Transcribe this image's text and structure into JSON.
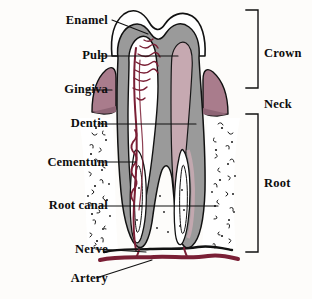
{
  "diagram": {
    "background_color": "#fdfcfa",
    "ink_color": "#111111"
  },
  "labels_left": [
    {
      "id": "enamel",
      "text": "Enamel",
      "x": 28,
      "y": 14,
      "w": 80
    },
    {
      "id": "pulp",
      "text": "Pulp",
      "x": 28,
      "y": 49,
      "w": 80
    },
    {
      "id": "gingiva",
      "text": "Gingiva",
      "x": 20,
      "y": 83,
      "w": 88
    },
    {
      "id": "dentin",
      "text": "Dentin",
      "x": 24,
      "y": 117,
      "w": 84
    },
    {
      "id": "cementum",
      "text": "Cementum",
      "x": 6,
      "y": 156,
      "w": 102
    },
    {
      "id": "root-canal",
      "text": "Root canal",
      "x": 10,
      "y": 199,
      "w": 98
    },
    {
      "id": "nerve",
      "text": "Nerve",
      "x": 38,
      "y": 243,
      "w": 70
    },
    {
      "id": "artery",
      "text": "Artery",
      "x": 36,
      "y": 272,
      "w": 72
    }
  ],
  "labels_right": [
    {
      "id": "crown",
      "text": "Crown",
      "x": 264,
      "y": 47
    },
    {
      "id": "neck",
      "text": "Neck",
      "x": 264,
      "y": 98
    },
    {
      "id": "root",
      "text": "Root",
      "x": 264,
      "y": 177
    }
  ],
  "colors": {
    "enamel": "#ffffff",
    "dentin": "#9a9a9a",
    "pulp": "#c9aab3",
    "pulp_chamber": "#ffffff",
    "gingiva": "#a97c8c",
    "gingiva_dark": "#8e6575",
    "vessel": "#7a1f35",
    "artery": "#7a1f35",
    "nerve": "#111111",
    "bone": "#ffffff",
    "outline": "#111111"
  },
  "structures": [
    {
      "name": "crown-enamel",
      "layer": "enamel",
      "region": "crown outer shell"
    },
    {
      "name": "dentin-body",
      "layer": "dentin",
      "region": "crown and root core"
    },
    {
      "name": "pulp-chamber",
      "layer": "pulp",
      "region": "central crown cavity"
    },
    {
      "name": "root-canal-left",
      "layer": "canal",
      "region": "left root channel"
    },
    {
      "name": "root-canal-right",
      "layer": "canal",
      "region": "right root channel"
    },
    {
      "name": "gingiva-left",
      "layer": "gingiva",
      "region": "left gum wedge"
    },
    {
      "name": "gingiva-right",
      "layer": "gingiva",
      "region": "right gum wedge"
    },
    {
      "name": "alveolar-bone",
      "layer": "bone",
      "region": "stippled jaw bone"
    },
    {
      "name": "nerve-trunk",
      "layer": "nerve",
      "region": "base black line"
    },
    {
      "name": "artery-trunk",
      "layer": "artery",
      "region": "base maroon band"
    }
  ]
}
